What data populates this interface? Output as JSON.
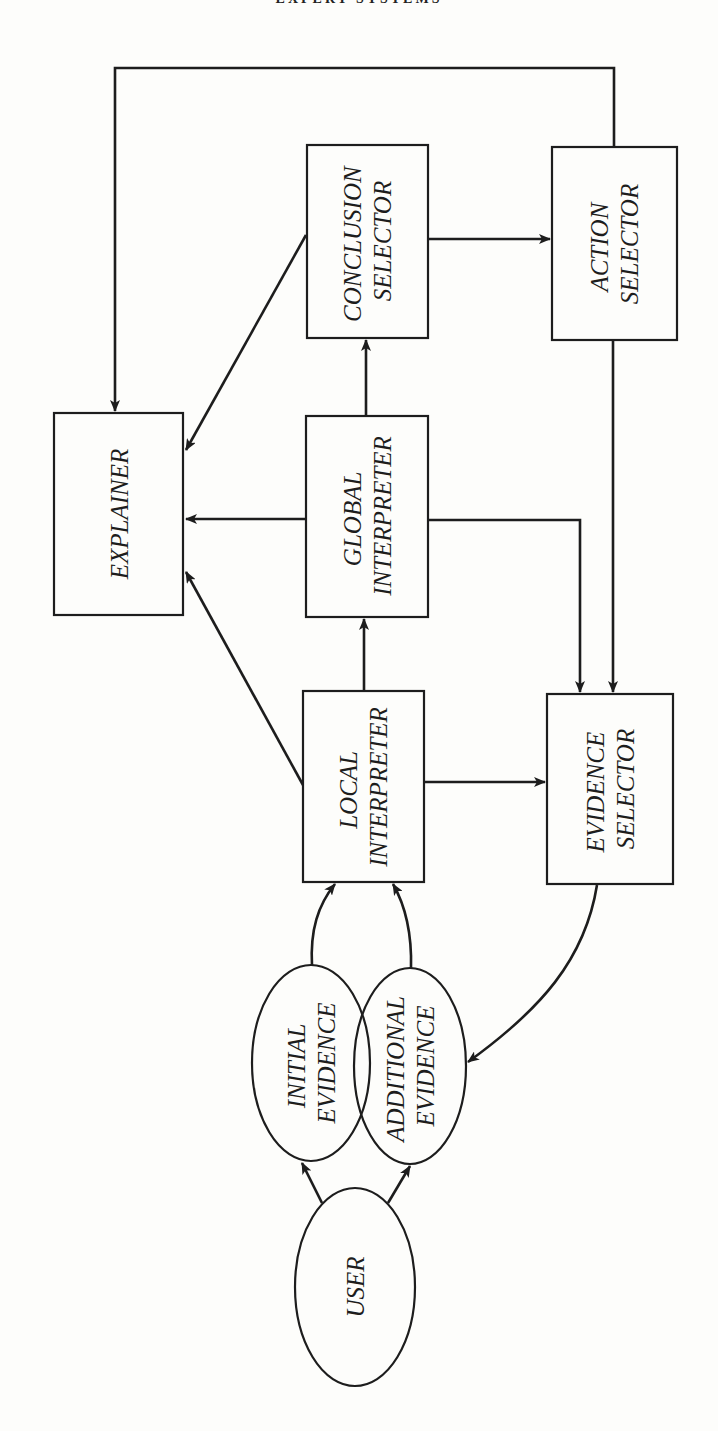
{
  "page": {
    "running_header": "EXPERT SYSTEMS"
  },
  "diagram": {
    "nodes": {
      "explainer": {
        "lines": [
          "EXPLAINER"
        ],
        "shape": "rectangle"
      },
      "conclusion_selector": {
        "lines": [
          "CONCLUSION",
          "SELECTOR"
        ],
        "shape": "rectangle"
      },
      "action_selector": {
        "lines": [
          "ACTION",
          "SELECTOR"
        ],
        "shape": "rectangle"
      },
      "global_interpreter": {
        "lines": [
          "GLOBAL",
          "INTERPRETER"
        ],
        "shape": "rectangle"
      },
      "local_interpreter": {
        "lines": [
          "LOCAL",
          "INTERPRETER"
        ],
        "shape": "rectangle"
      },
      "evidence_selector": {
        "lines": [
          "EVIDENCE",
          "SELECTOR"
        ],
        "shape": "rectangle"
      },
      "initial_evidence": {
        "lines": [
          "INITIAL",
          "EVIDENCE"
        ],
        "shape": "ellipse"
      },
      "additional_evidence": {
        "lines": [
          "ADDITIONAL",
          "EVIDENCE"
        ],
        "shape": "ellipse"
      },
      "user": {
        "lines": [
          "USER"
        ],
        "shape": "ellipse"
      }
    },
    "edges": [
      {
        "from": "user",
        "to": "initial_evidence"
      },
      {
        "from": "user",
        "to": "additional_evidence"
      },
      {
        "from": "initial_evidence",
        "to": "local_interpreter"
      },
      {
        "from": "additional_evidence",
        "to": "local_interpreter"
      },
      {
        "from": "local_interpreter",
        "to": "global_interpreter"
      },
      {
        "from": "local_interpreter",
        "to": "evidence_selector"
      },
      {
        "from": "local_interpreter",
        "to": "explainer"
      },
      {
        "from": "global_interpreter",
        "to": "conclusion_selector"
      },
      {
        "from": "global_interpreter",
        "to": "explainer"
      },
      {
        "from": "global_interpreter",
        "to": "evidence_selector"
      },
      {
        "from": "conclusion_selector",
        "to": "explainer"
      },
      {
        "from": "conclusion_selector",
        "to": "action_selector"
      },
      {
        "from": "action_selector",
        "to": "explainer"
      },
      {
        "from": "action_selector",
        "to": "evidence_selector"
      },
      {
        "from": "evidence_selector",
        "to": "additional_evidence"
      }
    ]
  }
}
